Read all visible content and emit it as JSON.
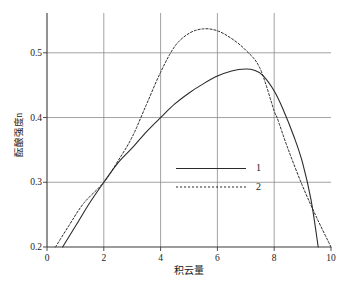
{
  "chart_data": {
    "type": "line",
    "title": "",
    "xlabel": "积云量",
    "ylabel": "酝酿强度n",
    "xlim": [
      0,
      10
    ],
    "ylim": [
      0.2,
      0.5615
    ],
    "grid": true,
    "xticks": [
      "0",
      "2",
      "4",
      "6",
      "8",
      "10"
    ],
    "xtick_values": [
      0,
      2,
      4,
      6,
      8,
      10
    ],
    "yticks": [
      "0.2",
      "0.3",
      "0.4",
      "0.5"
    ],
    "ytick_values": [
      0.2,
      0.3,
      0.4,
      0.5
    ],
    "legend_position": "center",
    "legend": [
      {
        "label": "1",
        "style": "solid"
      },
      {
        "label": "2",
        "style": "dotted"
      }
    ],
    "series": [
      {
        "name": "1",
        "style": "solid",
        "x": [
          0.55,
          1.0,
          1.5,
          2.0,
          2.5,
          3.0,
          3.5,
          4.0,
          4.5,
          5.0,
          5.5,
          6.0,
          6.5,
          7.0,
          7.3,
          7.6,
          8.0,
          8.3,
          8.7,
          9.0,
          9.3,
          9.55
        ],
        "y": [
          0.2,
          0.232,
          0.268,
          0.3,
          0.33,
          0.353,
          0.378,
          0.4,
          0.421,
          0.438,
          0.452,
          0.464,
          0.472,
          0.475,
          0.473,
          0.465,
          0.441,
          0.414,
          0.37,
          0.33,
          0.272,
          0.2
        ]
      },
      {
        "name": "2",
        "style": "dotted",
        "x": [
          0.3,
          0.8,
          1.3,
          2.0,
          2.5,
          3.0,
          3.5,
          4.0,
          4.5,
          5.0,
          5.5,
          6.0,
          6.5,
          7.0,
          7.5,
          8.0,
          8.1,
          8.5,
          9.0,
          9.5,
          10.0
        ],
        "y": [
          0.2,
          0.235,
          0.268,
          0.3,
          0.333,
          0.37,
          0.42,
          0.47,
          0.51,
          0.53,
          0.537,
          0.534,
          0.522,
          0.504,
          0.476,
          0.41,
          0.4,
          0.35,
          0.294,
          0.245,
          0.2
        ]
      }
    ]
  }
}
